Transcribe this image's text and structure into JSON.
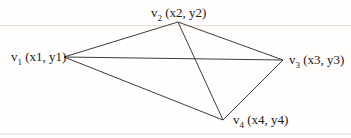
{
  "diagram": {
    "type": "graph",
    "line_color": "#3f3d3b",
    "background": "#fffefd",
    "text_color": "#1c1a18",
    "vertices": [
      {
        "id": "v1",
        "base": "v",
        "sub": "1",
        "coords": "(x1, y1)",
        "x": 64,
        "y": 57,
        "label_side": "left"
      },
      {
        "id": "v2",
        "base": "v",
        "sub": "2",
        "coords": "(x2, y2)",
        "x": 178,
        "y": 22,
        "label_side": "top"
      },
      {
        "id": "v3",
        "base": "v",
        "sub": "3",
        "coords": "(x3, y3)",
        "x": 283,
        "y": 60,
        "label_side": "right"
      },
      {
        "id": "v4",
        "base": "v",
        "sub": "4",
        "coords": "(x4, y4)",
        "x": 223,
        "y": 120,
        "label_side": "bottom-right"
      }
    ],
    "edges": [
      [
        "v1",
        "v2"
      ],
      [
        "v1",
        "v3"
      ],
      [
        "v1",
        "v4"
      ],
      [
        "v2",
        "v3"
      ],
      [
        "v2",
        "v4"
      ],
      [
        "v3",
        "v4"
      ]
    ]
  }
}
